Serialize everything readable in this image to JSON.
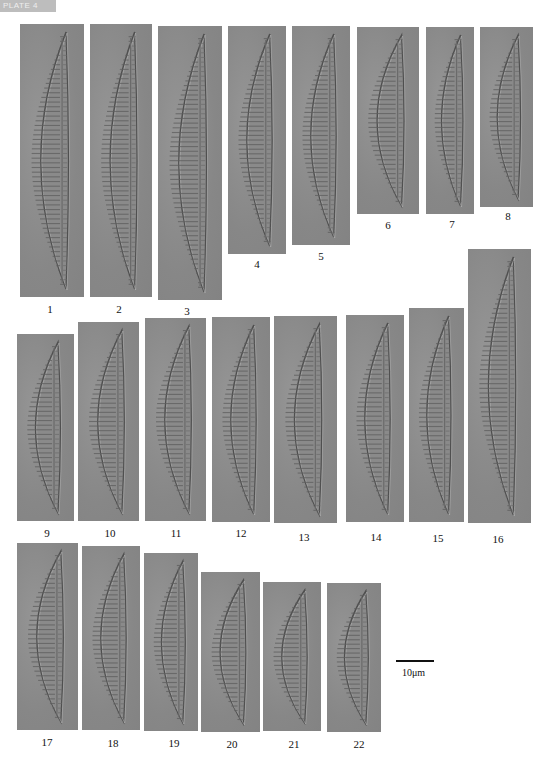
{
  "plate": {
    "tag": "PLATE 4"
  },
  "figure": {
    "panel_color": "#8c8c8c",
    "panels": [
      {
        "id": "1",
        "label": "1"
      },
      {
        "id": "2",
        "label": "2"
      },
      {
        "id": "3",
        "label": "3"
      },
      {
        "id": "4",
        "label": "4"
      },
      {
        "id": "5",
        "label": "5"
      },
      {
        "id": "6",
        "label": "6"
      },
      {
        "id": "7",
        "label": "7"
      },
      {
        "id": "8",
        "label": "8"
      },
      {
        "id": "9",
        "label": "9"
      },
      {
        "id": "10",
        "label": "10"
      },
      {
        "id": "11",
        "label": "11"
      },
      {
        "id": "12",
        "label": "12"
      },
      {
        "id": "13",
        "label": "13"
      },
      {
        "id": "14",
        "label": "14"
      },
      {
        "id": "15",
        "label": "15"
      },
      {
        "id": "16",
        "label": "16"
      },
      {
        "id": "17",
        "label": "17"
      },
      {
        "id": "18",
        "label": "18"
      },
      {
        "id": "19",
        "label": "19"
      },
      {
        "id": "20",
        "label": "20"
      },
      {
        "id": "21",
        "label": "21"
      },
      {
        "id": "22",
        "label": "22"
      }
    ],
    "scale_bar": {
      "label": "10μm"
    }
  }
}
